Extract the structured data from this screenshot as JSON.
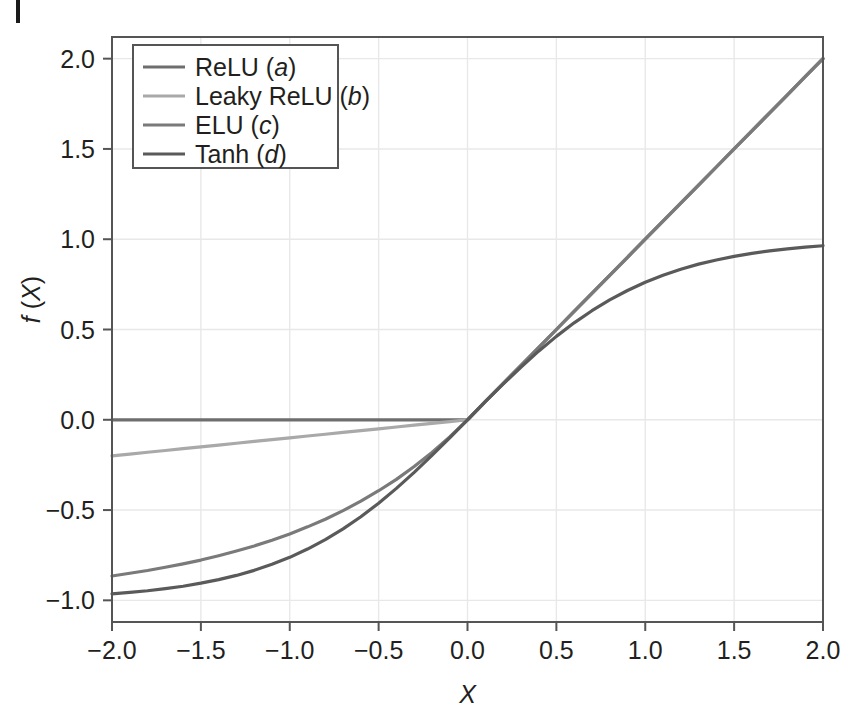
{
  "chart_data": {
    "type": "line",
    "title": "",
    "xlabel": "X",
    "ylabel": "f (X)",
    "xlim": [
      -2.0,
      2.0
    ],
    "ylim": [
      -1.12,
      2.12
    ],
    "xticks": [
      "-2.0",
      "-1.5",
      "-1.0",
      "-0.5",
      "0.0",
      "0.5",
      "1.0",
      "1.5",
      "2.0"
    ],
    "xtick_values": [
      -2.0,
      -1.5,
      -1.0,
      -0.5,
      0.0,
      0.5,
      1.0,
      1.5,
      2.0
    ],
    "yticks": [
      "2.0",
      "1.5",
      "1.0",
      "0.5",
      "0.0",
      "-0.5",
      "-1.0"
    ],
    "ytick_values": [
      2.0,
      1.5,
      1.0,
      0.5,
      0.0,
      -0.5,
      -1.0
    ],
    "grid": true,
    "legend_position": "upper left",
    "x": [
      -2.0,
      -1.9,
      -1.8,
      -1.7,
      -1.6,
      -1.5,
      -1.4,
      -1.3,
      -1.2,
      -1.1,
      -1.0,
      -0.9,
      -0.8,
      -0.7,
      -0.6,
      -0.5,
      -0.4,
      -0.3,
      -0.2,
      -0.1,
      0.0,
      0.1,
      0.2,
      0.3,
      0.4,
      0.5,
      0.6,
      0.7,
      0.8,
      0.9,
      1.0,
      1.1,
      1.2,
      1.3,
      1.4,
      1.5,
      1.6,
      1.7,
      1.8,
      1.9,
      2.0
    ],
    "series": [
      {
        "name": "ReLU (a)",
        "legend_label": "ReLU",
        "legend_suffix": "a",
        "color": "#6e6e6e",
        "width": 3.2,
        "values": [
          0.0,
          0.0,
          0.0,
          0.0,
          0.0,
          0.0,
          0.0,
          0.0,
          0.0,
          0.0,
          0.0,
          0.0,
          0.0,
          0.0,
          0.0,
          0.0,
          0.0,
          0.0,
          0.0,
          0.0,
          0.0,
          0.1,
          0.2,
          0.3,
          0.4,
          0.5,
          0.6,
          0.7,
          0.8,
          0.9,
          1.0,
          1.1,
          1.2,
          1.3,
          1.4,
          1.5,
          1.6,
          1.7,
          1.8,
          1.9,
          2.0
        ]
      },
      {
        "name": "Leaky ReLU (b)",
        "legend_label": "Leaky ReLU",
        "legend_suffix": "b",
        "color": "#a9a9a9",
        "width": 3.2,
        "values": [
          -0.2,
          -0.19,
          -0.18,
          -0.17,
          -0.16,
          -0.15,
          -0.14,
          -0.13,
          -0.12,
          -0.11,
          -0.1,
          -0.09,
          -0.08,
          -0.07,
          -0.06,
          -0.05,
          -0.04,
          -0.03,
          -0.02,
          -0.01,
          0.0,
          0.1,
          0.2,
          0.3,
          0.4,
          0.5,
          0.6,
          0.7,
          0.8,
          0.9,
          1.0,
          1.1,
          1.2,
          1.3,
          1.4,
          1.5,
          1.6,
          1.7,
          1.8,
          1.9,
          2.0
        ]
      },
      {
        "name": "ELU (c)",
        "legend_label": "ELU",
        "legend_suffix": "c",
        "color": "#7a7a7a",
        "width": 3.2,
        "values": [
          -0.865,
          -0.85,
          -0.835,
          -0.817,
          -0.798,
          -0.777,
          -0.753,
          -0.727,
          -0.699,
          -0.667,
          -0.632,
          -0.593,
          -0.551,
          -0.503,
          -0.451,
          -0.393,
          -0.33,
          -0.259,
          -0.181,
          -0.095,
          0.0,
          0.1,
          0.2,
          0.3,
          0.4,
          0.5,
          0.6,
          0.7,
          0.8,
          0.9,
          1.0,
          1.1,
          1.2,
          1.3,
          1.4,
          1.5,
          1.6,
          1.7,
          1.8,
          1.9,
          2.0
        ]
      },
      {
        "name": "Tanh (d)",
        "legend_label": "Tanh",
        "legend_suffix": "d",
        "color": "#5a5a5a",
        "width": 3.2,
        "values": [
          -0.964,
          -0.956,
          -0.947,
          -0.935,
          -0.922,
          -0.905,
          -0.885,
          -0.862,
          -0.834,
          -0.8,
          -0.762,
          -0.716,
          -0.664,
          -0.604,
          -0.537,
          -0.462,
          -0.38,
          -0.291,
          -0.197,
          -0.1,
          0.0,
          0.1,
          0.197,
          0.291,
          0.38,
          0.462,
          0.537,
          0.604,
          0.664,
          0.716,
          0.762,
          0.8,
          0.834,
          0.862,
          0.885,
          0.905,
          0.922,
          0.935,
          0.947,
          0.956,
          0.964
        ]
      }
    ],
    "annotations": []
  },
  "figure": {
    "background_color": "#ffffff",
    "axis_color": "#555555",
    "grid_color": "#e8e8e8",
    "text_color": "#231f20"
  }
}
